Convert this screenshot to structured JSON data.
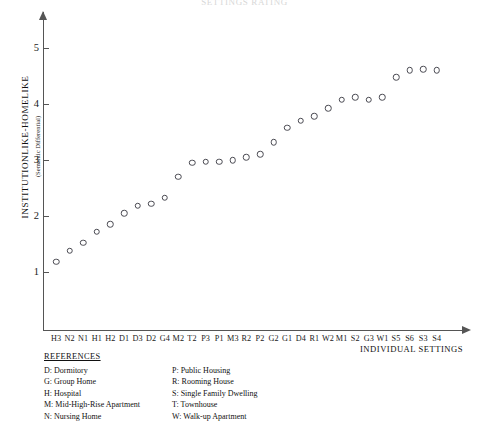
{
  "cut_title": "SETTINGS RATING",
  "axis": {
    "y_title": "INSTITUTIONLIKE-HOMELIKE",
    "y_subtitle": "(Semantic Differential)",
    "x_title": "INDIVIDUAL SETTINGS"
  },
  "references": {
    "heading": "REFERENCES",
    "left": [
      "D: Dormitory",
      "G: Group Home",
      "H: Hospital",
      "M: Mid-High-Rise Apartment",
      "N: Nursing Home"
    ],
    "right": [
      "P: Public Housing",
      "R: Rooming House",
      "S: Single Family Dwelling",
      "T: Townhouse",
      "W: Walk-up  Apartment"
    ]
  },
  "chart_data": {
    "type": "scatter",
    "title": "SETTINGS RATING",
    "xlabel": "INDIVIDUAL SETTINGS",
    "ylabel": "INSTITUTIONLIKE-HOMELIKE (Semantic Differential)",
    "ylim": [
      0.6,
      5.6
    ],
    "yticks": [
      1,
      2,
      3,
      4,
      5
    ],
    "grid": false,
    "legend": false,
    "marker": "open-circle",
    "categories": [
      "H3",
      "N2",
      "N1",
      "H1",
      "H2",
      "D1",
      "D3",
      "D2",
      "G4",
      "M2",
      "T2",
      "P3",
      "P1",
      "M3",
      "R2",
      "P2",
      "G2",
      "G1",
      "D4",
      "R1",
      "W2",
      "M1",
      "S2",
      "G3",
      "W1",
      "S5",
      "S6",
      "S3",
      "S4"
    ],
    "values": [
      1.18,
      1.38,
      1.52,
      1.72,
      1.85,
      2.05,
      2.18,
      2.22,
      2.33,
      2.7,
      2.95,
      2.97,
      2.97,
      3.0,
      3.05,
      3.1,
      3.32,
      3.58,
      3.7,
      3.78,
      3.92,
      4.08,
      4.12,
      4.08,
      4.12,
      4.48,
      4.6,
      4.62,
      4.6
    ]
  }
}
